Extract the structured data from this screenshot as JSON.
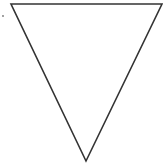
{
  "diagram": {
    "shape": "inverted-triangle",
    "stroke_color": "#333333",
    "fill_color": "#ffffff",
    "vertices": {
      "top_left": [
        11,
        4
      ],
      "top_right": [
        162,
        4
      ],
      "bottom": [
        86,
        161
      ]
    },
    "marker_dot": [
      3,
      16
    ]
  }
}
